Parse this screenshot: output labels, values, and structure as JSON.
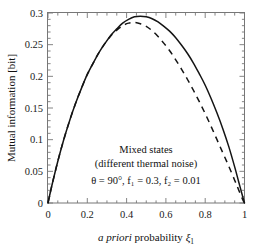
{
  "chart_data": {
    "type": "line",
    "title": "",
    "xlabel": "a priori probability ξ₁",
    "xlabel_italic_part": "a priori",
    "xlabel_roman_part": "probability",
    "xlabel_symbol": "ξ",
    "xlabel_symbol_sub": "1",
    "ylabel": "Mutual information [bit]",
    "xlim": [
      0,
      1
    ],
    "ylim": [
      0,
      0.3
    ],
    "xticks": [
      "0",
      "0.2",
      "0.4",
      "0.6",
      "0.8",
      "1"
    ],
    "xtick_values": [
      0,
      0.2,
      0.4,
      0.6,
      0.8,
      1
    ],
    "yticks": [
      "0",
      "0.05",
      "0.1",
      "0.15",
      "0.2",
      "0.25",
      "0.3"
    ],
    "ytick_values": [
      0,
      0.05,
      0.1,
      0.15,
      0.2,
      0.25,
      0.3
    ],
    "grid": false,
    "legend_position": "none",
    "annotations": [
      "Mixed states",
      "(different thermal noise)",
      "θ = 90°, f₁ = 0.3, f₂ = 0.01"
    ],
    "annotation_params": {
      "theta": "90°",
      "f1": "0.3",
      "f2": "0.01"
    },
    "series": [
      {
        "name": "solid",
        "style": "solid",
        "color": "#141414",
        "x": [
          0.0,
          0.02,
          0.05,
          0.08,
          0.11,
          0.14,
          0.17,
          0.2,
          0.23,
          0.26,
          0.29,
          0.32,
          0.35,
          0.38,
          0.41,
          0.44,
          0.47,
          0.5,
          0.53,
          0.56,
          0.59,
          0.62,
          0.65,
          0.68,
          0.71,
          0.74,
          0.77,
          0.8,
          0.83,
          0.86,
          0.89,
          0.92,
          0.95,
          0.97,
          0.99,
          1.0
        ],
        "y": [
          0.0,
          0.028,
          0.066,
          0.1,
          0.13,
          0.157,
          0.181,
          0.203,
          0.221,
          0.238,
          0.252,
          0.265,
          0.275,
          0.284,
          0.29,
          0.294,
          0.295,
          0.294,
          0.291,
          0.286,
          0.279,
          0.271,
          0.261,
          0.249,
          0.236,
          0.221,
          0.204,
          0.186,
          0.165,
          0.142,
          0.117,
          0.089,
          0.057,
          0.034,
          0.011,
          0.0
        ]
      },
      {
        "name": "dashed",
        "style": "dashed",
        "color": "#141414",
        "x": [
          0.0,
          0.02,
          0.05,
          0.08,
          0.11,
          0.14,
          0.17,
          0.2,
          0.23,
          0.26,
          0.29,
          0.32,
          0.35,
          0.38,
          0.41,
          0.44,
          0.47,
          0.5,
          0.53,
          0.56,
          0.59,
          0.62,
          0.65,
          0.68,
          0.71,
          0.74,
          0.77,
          0.8,
          0.83,
          0.86,
          0.89,
          0.92,
          0.95,
          0.97,
          0.99,
          1.0
        ],
        "y": [
          0.0,
          0.028,
          0.066,
          0.1,
          0.13,
          0.157,
          0.181,
          0.203,
          0.221,
          0.238,
          0.252,
          0.264,
          0.273,
          0.28,
          0.284,
          0.285,
          0.283,
          0.279,
          0.272,
          0.263,
          0.252,
          0.24,
          0.226,
          0.211,
          0.195,
          0.178,
          0.16,
          0.141,
          0.121,
          0.1,
          0.079,
          0.058,
          0.036,
          0.021,
          0.006,
          0.0
        ]
      }
    ]
  }
}
